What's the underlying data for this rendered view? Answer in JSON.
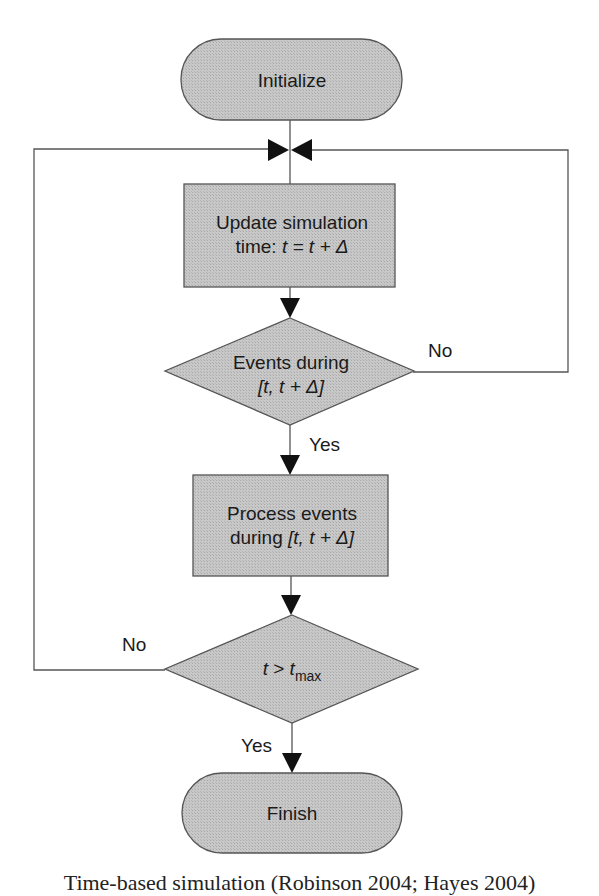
{
  "diagram": {
    "type": "flowchart",
    "fill_color": "#c4c4c4",
    "stroke_color": "#555555",
    "arrow_color": "#111111",
    "nodes": {
      "initialize": {
        "shape": "terminator",
        "label": "Initialize"
      },
      "update_time": {
        "shape": "process",
        "line1": "Update simulation",
        "line2_prefix": "time: ",
        "line2_math": "t = t + Δ"
      },
      "events_check": {
        "shape": "decision",
        "line1": "Events during",
        "line2_math": "[t, t + Δ]"
      },
      "process_events": {
        "shape": "process",
        "line1": "Process events",
        "line2_prefix": "during ",
        "line2_math": "[t, t + Δ]"
      },
      "time_check": {
        "shape": "decision",
        "math_var": "t",
        "math_op": " > ",
        "math_var2": "t",
        "math_sub": "max"
      },
      "finish": {
        "shape": "terminator",
        "label": "Finish"
      }
    },
    "edges": [
      {
        "from": "initialize",
        "to": "update_time",
        "label": ""
      },
      {
        "from": "update_time",
        "to": "events_check",
        "label": ""
      },
      {
        "from": "events_check",
        "to": "process_events",
        "label": "Yes"
      },
      {
        "from": "events_check",
        "to": "update_time",
        "label": "No"
      },
      {
        "from": "process_events",
        "to": "time_check",
        "label": ""
      },
      {
        "from": "time_check",
        "to": "update_time",
        "label": "No"
      },
      {
        "from": "time_check",
        "to": "finish",
        "label": "Yes"
      }
    ],
    "labels": {
      "events_no": "No",
      "events_yes": "Yes",
      "time_no": "No",
      "time_yes": "Yes"
    }
  },
  "caption": "Time-based simulation (Robinson 2004; Hayes 2004)"
}
